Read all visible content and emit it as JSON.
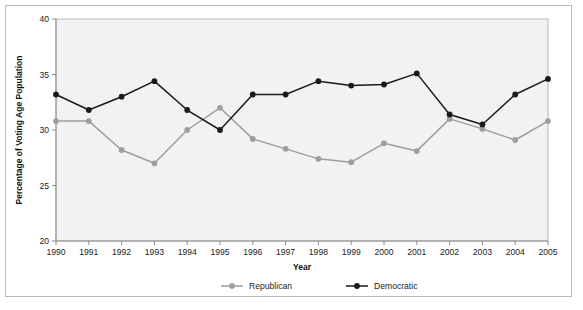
{
  "chart_data": {
    "type": "line",
    "title": "",
    "xlabel": "Year",
    "ylabel": "Percentage of Voting Age Population",
    "categories": [
      1990,
      1991,
      1992,
      1993,
      1994,
      1995,
      1996,
      1997,
      1998,
      1999,
      2000,
      2001,
      2002,
      2003,
      2004,
      2005
    ],
    "x": [
      "1990",
      "1991",
      "1992",
      "1993",
      "1994",
      "1995",
      "1996",
      "1997",
      "1998",
      "1999",
      "2000",
      "2001",
      "2002",
      "2003",
      "2004",
      "2005"
    ],
    "xlim": [
      1990,
      2005
    ],
    "ylim": [
      20,
      40
    ],
    "yticks": [
      "20",
      "25",
      "30",
      "35",
      "40"
    ],
    "ytick_values": [
      20,
      25,
      30,
      35,
      40
    ],
    "grid": false,
    "legend_position": "bottom-center",
    "series": [
      {
        "name": "Republican",
        "color": "#9e9e9e",
        "marker": "circle",
        "values": [
          30.8,
          30.8,
          28.2,
          27.0,
          30.0,
          32.0,
          29.2,
          28.3,
          27.4,
          27.1,
          28.8,
          28.1,
          31.0,
          30.1,
          29.1,
          30.8
        ]
      },
      {
        "name": "Democratic",
        "color": "#1a1a1a",
        "marker": "circle",
        "values": [
          33.2,
          31.8,
          33.0,
          34.4,
          31.8,
          30.0,
          33.2,
          33.2,
          34.4,
          34.0,
          34.1,
          35.1,
          31.4,
          30.5,
          33.2,
          34.6
        ]
      }
    ]
  },
  "figure": {
    "plot_background": "#f2f2f2",
    "frame_color": "#b9b9b9",
    "axis_color": "#8a8a8a"
  }
}
